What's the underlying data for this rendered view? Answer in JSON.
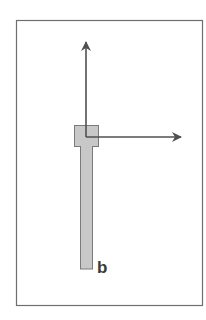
{
  "diagram": {
    "label": "b",
    "colors": {
      "frame": "#6e6e6e",
      "arrow": "#505050",
      "body_fill": "#c8c8c8",
      "body_stroke": "#7a7a7a",
      "label": "#3a3a3a"
    },
    "elements": [
      {
        "type": "frame",
        "desc": "rectangular border"
      },
      {
        "type": "arrow",
        "direction": "up",
        "desc": "vertical axis arrow"
      },
      {
        "type": "arrow",
        "direction": "right",
        "desc": "horizontal axis arrow"
      },
      {
        "type": "shape",
        "desc": "gray bar with wider head block (key/pin shape)"
      },
      {
        "type": "text",
        "desc": "label b"
      }
    ]
  }
}
